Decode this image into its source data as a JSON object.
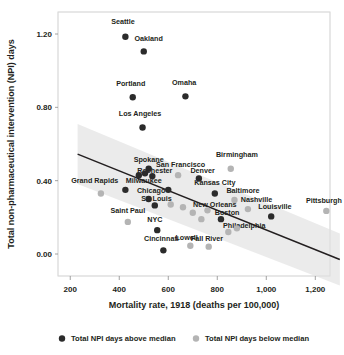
{
  "chart_data": {
    "type": "scatter",
    "title": "",
    "xlabel": "Mortality rate, 1918 (deaths per 100,000)",
    "ylabel": "Total non-pharmaceutical intervention (NPI) days",
    "xlim": [
      150,
      1260
    ],
    "ylim": [
      -0.12,
      1.32
    ],
    "xticks": [
      200,
      400,
      600,
      800,
      1000,
      1200
    ],
    "xticklabels": [
      "200",
      "400",
      "600",
      "800",
      "1,000",
      "1,200"
    ],
    "yticks": [
      0.0,
      0.4,
      0.8,
      1.2
    ],
    "yticklabels": [
      "0.00",
      "0.40",
      "0.80",
      "1.20"
    ],
    "grid": false,
    "legend_position": "bottom",
    "legend": [
      {
        "label": "Total NPI days above median",
        "color": "#2b2b2b",
        "series": "above"
      },
      {
        "label": "Total NPI days below median",
        "color": "#b4b4b4",
        "series": "below"
      }
    ],
    "trendline": {
      "label": "linear fit",
      "x_start": 230,
      "y_start": 0.545,
      "x_end": 1300,
      "y_end": -0.03,
      "color": "#231f20",
      "band_color": "#e8e8e8"
    },
    "points": [
      {
        "label": "Seattle",
        "x": 425,
        "y": 1.185,
        "series": "above",
        "lx": 415,
        "ly": 1.265,
        "anchor": "middle"
      },
      {
        "label": "Oakland",
        "x": 500,
        "y": 1.105,
        "series": "above",
        "lx": 520,
        "ly": 1.175,
        "anchor": "middle"
      },
      {
        "label": "Portland",
        "x": 455,
        "y": 0.855,
        "series": "above",
        "lx": 447,
        "ly": 0.93,
        "anchor": "middle"
      },
      {
        "label": "Omaha",
        "x": 670,
        "y": 0.86,
        "series": "above",
        "lx": 665,
        "ly": 0.935,
        "anchor": "middle"
      },
      {
        "label": "Los Angeles",
        "x": 495,
        "y": 0.69,
        "series": "above",
        "lx": 485,
        "ly": 0.765,
        "anchor": "middle"
      },
      {
        "label": "Birmingham",
        "x": 855,
        "y": 0.465,
        "series": "below",
        "lx": 880,
        "ly": 0.54,
        "anchor": "middle"
      },
      {
        "label": "Spokane",
        "x": 520,
        "y": 0.465,
        "series": "above",
        "lx": 520,
        "ly": 0.512,
        "anchor": "middle"
      },
      {
        "label": "San Francisco",
        "x": 640,
        "y": 0.43,
        "series": "below",
        "lx": 650,
        "ly": 0.487,
        "anchor": "middle"
      },
      {
        "label": "Denver",
        "x": 725,
        "y": 0.412,
        "series": "above",
        "lx": 740,
        "ly": 0.455,
        "anchor": "middle"
      },
      {
        "label": "Rochester",
        "x": 535,
        "y": 0.425,
        "series": "above",
        "lx": 545,
        "ly": 0.452,
        "anchor": "middle"
      },
      {
        "label": "Grand Rapids",
        "x": 325,
        "y": 0.33,
        "series": "below",
        "lx": 300,
        "ly": 0.398,
        "anchor": "middle"
      },
      {
        "label": "Milwaukee",
        "x": 425,
        "y": 0.35,
        "series": "above",
        "lx": 500,
        "ly": 0.398,
        "anchor": "middle"
      },
      {
        "label": "Kansas City",
        "x": 790,
        "y": 0.33,
        "series": "above",
        "lx": 790,
        "ly": 0.39,
        "anchor": "middle"
      },
      {
        "label": "Baltimore",
        "x": 870,
        "y": 0.295,
        "series": "below",
        "lx": 905,
        "ly": 0.345,
        "anchor": "middle"
      },
      {
        "label": "Chicago",
        "x": 520,
        "y": 0.3,
        "series": "above",
        "lx": 530,
        "ly": 0.342,
        "anchor": "middle"
      },
      {
        "label": "St. Louis",
        "x": 545,
        "y": 0.265,
        "series": "above",
        "lx": 552,
        "ly": 0.3,
        "anchor": "middle"
      },
      {
        "label": "Nashville",
        "x": 925,
        "y": 0.245,
        "series": "below",
        "lx": 960,
        "ly": 0.295,
        "anchor": "middle"
      },
      {
        "label": "Pittsburgh",
        "x": 1245,
        "y": 0.235,
        "series": "below",
        "lx": 1235,
        "ly": 0.29,
        "anchor": "middle"
      },
      {
        "label": "New Orleans",
        "x": 760,
        "y": 0.238,
        "series": "below",
        "lx": 790,
        "ly": 0.268,
        "anchor": "middle"
      },
      {
        "label": "Louisville",
        "x": 1020,
        "y": 0.205,
        "series": "above",
        "lx": 1035,
        "ly": 0.255,
        "anchor": "middle"
      },
      {
        "label": "Saint Paul",
        "x": 435,
        "y": 0.175,
        "series": "below",
        "lx": 435,
        "ly": 0.232,
        "anchor": "middle"
      },
      {
        "label": "Boston",
        "x": 815,
        "y": 0.19,
        "series": "above",
        "lx": 840,
        "ly": 0.222,
        "anchor": "middle"
      },
      {
        "label": "NYC",
        "x": 555,
        "y": 0.13,
        "series": "above",
        "lx": 545,
        "ly": 0.185,
        "anchor": "middle"
      },
      {
        "label": "Philadelphia",
        "x": 880,
        "y": 0.14,
        "series": "below",
        "lx": 910,
        "ly": 0.155,
        "anchor": "middle"
      },
      {
        "label": "Lowell",
        "x": 690,
        "y": 0.045,
        "series": "below",
        "lx": 675,
        "ly": 0.085,
        "anchor": "middle"
      },
      {
        "label": "Fall River",
        "x": 765,
        "y": 0.04,
        "series": "below",
        "lx": 758,
        "ly": 0.082,
        "anchor": "middle"
      },
      {
        "label": "Cincinnati",
        "x": 580,
        "y": 0.02,
        "series": "above",
        "lx": 572,
        "ly": 0.082,
        "anchor": "middle"
      },
      {
        "label": "",
        "x": 610,
        "y": 0.27,
        "series": "below",
        "lx": 0,
        "ly": 0,
        "anchor": "middle"
      },
      {
        "label": "",
        "x": 660,
        "y": 0.255,
        "series": "below",
        "lx": 0,
        "ly": 0,
        "anchor": "middle"
      },
      {
        "label": "",
        "x": 700,
        "y": 0.225,
        "series": "below",
        "lx": 0,
        "ly": 0,
        "anchor": "middle"
      },
      {
        "label": "",
        "x": 735,
        "y": 0.19,
        "series": "below",
        "lx": 0,
        "ly": 0,
        "anchor": "middle"
      },
      {
        "label": "",
        "x": 845,
        "y": 0.12,
        "series": "below",
        "lx": 0,
        "ly": 0,
        "anchor": "middle"
      },
      {
        "label": "",
        "x": 480,
        "y": 0.43,
        "series": "above",
        "lx": 0,
        "ly": 0,
        "anchor": "middle"
      },
      {
        "label": "",
        "x": 505,
        "y": 0.44,
        "series": "above",
        "lx": 0,
        "ly": 0,
        "anchor": "middle"
      },
      {
        "label": "",
        "x": 600,
        "y": 0.35,
        "series": "above",
        "lx": 0,
        "ly": 0,
        "anchor": "middle"
      }
    ]
  }
}
